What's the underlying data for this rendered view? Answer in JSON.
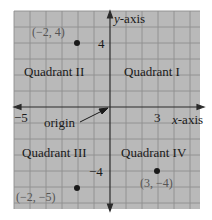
{
  "diagram": {
    "colors": {
      "background": "#b9b9b9",
      "grid": "#8e8e8e",
      "axis": "#2a2a2a",
      "point": "#1a1a1a",
      "text": "#1a1a1a",
      "coord_text": "#555555"
    },
    "axes": {
      "x_label_var": "x",
      "x_label_rest": "-axis",
      "y_label_var": "y",
      "y_label_rest": "-axis",
      "x_tick": "3",
      "x_neg_tick": "−5",
      "y_tick": "4",
      "y_neg_tick": "−4"
    },
    "quadrants": {
      "q1": "Quadrant I",
      "q2": "Quadrant II",
      "q3": "Quadrant III",
      "q4": "Quadrant IV"
    },
    "origin_label": "origin",
    "points": [
      {
        "label": "(−2, 4)",
        "x": -2,
        "y": 4
      },
      {
        "label": "(−2, −5)",
        "x": -2,
        "y": -5
      },
      {
        "label": "(3, −4)",
        "x": 3,
        "y": -4
      }
    ]
  }
}
